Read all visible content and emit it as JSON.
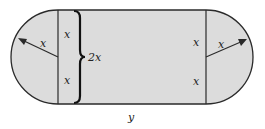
{
  "diagram": {
    "fill_color": "#dcdcdc",
    "stroke_color": "#2a2a2a",
    "labels": {
      "left_radius": "x",
      "right_radius": "x",
      "left_upper_half": "x",
      "left_lower_half": "x",
      "brace_total": "2x",
      "right_upper_half": "x",
      "right_lower_half": "x",
      "rectangle_length": "y"
    }
  }
}
